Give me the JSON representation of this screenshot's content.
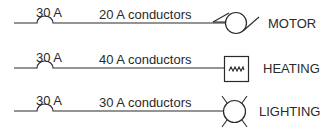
{
  "diagram": {
    "stroke_color": "#2a2a2a",
    "circuits": [
      {
        "breaker_label": "30 A",
        "conductor_label": "20 A conductors",
        "load_label": "MOTOR",
        "load_symbol": "motor-icon"
      },
      {
        "breaker_label": "30 A",
        "conductor_label": "40 A conductors",
        "load_label": "HEATING",
        "load_symbol": "heating-element-icon"
      },
      {
        "breaker_label": "30 A",
        "conductor_label": "30 A conductors",
        "load_label": "LIGHTING",
        "load_symbol": "lamp-icon"
      }
    ]
  }
}
